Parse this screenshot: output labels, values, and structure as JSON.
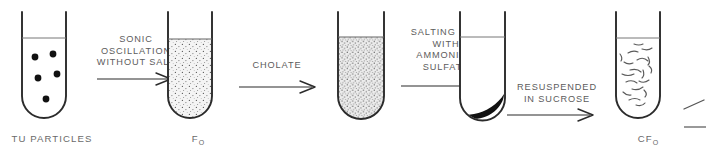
{
  "diagram": {
    "background_color": "#ffffff",
    "ink_color": "#2b2b2b",
    "text_color": "#5c5c5c",
    "pellet_color": "#111111"
  },
  "tubes": [
    {
      "id": "tube-1",
      "label": "TU PARTICLES",
      "label_sub": "",
      "contents": "five large black particles suspended in clear liquid",
      "fill_style": "clear",
      "particle_count": 5
    },
    {
      "id": "tube-2",
      "label": "F",
      "label_sub": "O",
      "contents": "fine stippled suspension",
      "fill_style": "light-stipple",
      "particle_count": 0
    },
    {
      "id": "tube-3",
      "label": "",
      "label_sub": "",
      "contents": "dense stippled suspension",
      "fill_style": "dense-stipple",
      "particle_count": 0
    },
    {
      "id": "tube-4",
      "label": "",
      "label_sub": "",
      "contents": "dark pellet settled at bottom with clear supernatant",
      "fill_style": "pellet",
      "particle_count": 0
    },
    {
      "id": "tube-5",
      "label": "CF",
      "label_sub": "O",
      "contents": "curved squiggle fragments suspended in sucrose",
      "fill_style": "squiggles",
      "particle_count": 18
    }
  ],
  "steps": [
    {
      "id": "step-1",
      "lines": [
        "SONIC",
        "OSCILLATION",
        "WITHOUT SALT"
      ]
    },
    {
      "id": "step-2",
      "lines": [
        "CHOLATE"
      ]
    },
    {
      "id": "step-3",
      "lines": [
        "SALTING OUT",
        "WITH",
        "AMMONIUM",
        "SULFATE"
      ]
    },
    {
      "id": "step-4",
      "lines": [
        "RESUSPENDED",
        "IN SUCROSE"
      ]
    }
  ]
}
